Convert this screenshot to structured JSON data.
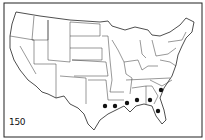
{
  "figure": {
    "number_label": "150",
    "ink_color": "#111111",
    "background": "#ffffff"
  },
  "occurrence_points": [
    {
      "state": "Texas (east)",
      "x": 105,
      "y": 106
    },
    {
      "state": "Louisiana",
      "x": 115,
      "y": 106
    },
    {
      "state": "Mississippi",
      "x": 127,
      "y": 103
    },
    {
      "state": "Alabama",
      "x": 137,
      "y": 100
    },
    {
      "state": "Georgia",
      "x": 150,
      "y": 100
    },
    {
      "state": "South Carolina",
      "x": 161,
      "y": 90
    },
    {
      "state": "Florida (north)",
      "x": 158,
      "y": 111
    }
  ]
}
